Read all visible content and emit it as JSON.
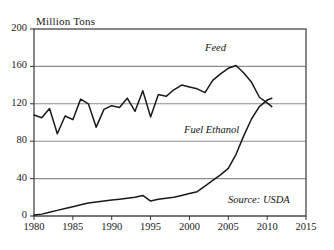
{
  "chart_data": {
    "type": "line",
    "title": "",
    "ylabel": "Million Tons",
    "xlabel": "",
    "ylim": [
      0,
      200
    ],
    "xlim": [
      1980,
      2015
    ],
    "yticks": [
      "0",
      "40",
      "80",
      "120",
      "160",
      "200"
    ],
    "ytick_values": [
      0,
      40,
      80,
      120,
      160,
      200
    ],
    "xticks": [
      "1980",
      "1985",
      "1990",
      "1995",
      "2000",
      "2005",
      "2010",
      "2015"
    ],
    "xtick_values": [
      1980,
      1985,
      1990,
      1995,
      2000,
      2005,
      2010,
      2015
    ],
    "grid": "horizontal",
    "legend": "inline-annotations",
    "annotations": [
      {
        "text": "Feed",
        "x": 2002,
        "y": 182
      },
      {
        "text": "Fuel Ethanol",
        "x": 1999,
        "y": 93
      },
      {
        "text": "Source: USDA",
        "x": 2009,
        "y": 17
      }
    ],
    "series": [
      {
        "name": "Feed",
        "color": "#1a1a1a",
        "x": [
          1980,
          1981,
          1982,
          1983,
          1984,
          1985,
          1986,
          1987,
          1988,
          1989,
          1990,
          1991,
          1992,
          1993,
          1994,
          1995,
          1996,
          1997,
          1998,
          1999,
          2000,
          2001,
          2002,
          2003,
          2004,
          2005,
          2006,
          2007,
          2008,
          2009,
          2010,
          2010.6
        ],
        "values": [
          108,
          105,
          115,
          88,
          107,
          103,
          125,
          120,
          95,
          114,
          118,
          116,
          126,
          112,
          134,
          106,
          130,
          128,
          135,
          140,
          138,
          136,
          132,
          145,
          152,
          158,
          161,
          153,
          143,
          127,
          121,
          117
        ]
      },
      {
        "name": "Fuel Ethanol",
        "color": "#1a1a1a",
        "x": [
          1980,
          1981,
          1982,
          1983,
          1984,
          1985,
          1986,
          1987,
          1988,
          1989,
          1990,
          1991,
          1992,
          1993,
          1994,
          1995,
          1996,
          1997,
          1998,
          1999,
          2000,
          2001,
          2002,
          2003,
          2004,
          2005,
          2006,
          2007,
          2008,
          2009,
          2010,
          2010.6
        ],
        "values": [
          1,
          2,
          4,
          6,
          8,
          10,
          12,
          14,
          15,
          16,
          17,
          18,
          19,
          20,
          22,
          16,
          18,
          19,
          20,
          22,
          24,
          26,
          32,
          38,
          44,
          51,
          66,
          86,
          104,
          117,
          124,
          126
        ]
      }
    ]
  },
  "axis": {
    "y_title": "Million Tons"
  },
  "labels": {
    "feed": "Feed",
    "fuel_ethanol": "Fuel Ethanol",
    "source": "Source: USDA"
  },
  "colors": {
    "line": "#1a1a1a",
    "grid": "#8c8c8c",
    "frame": "#555555"
  }
}
